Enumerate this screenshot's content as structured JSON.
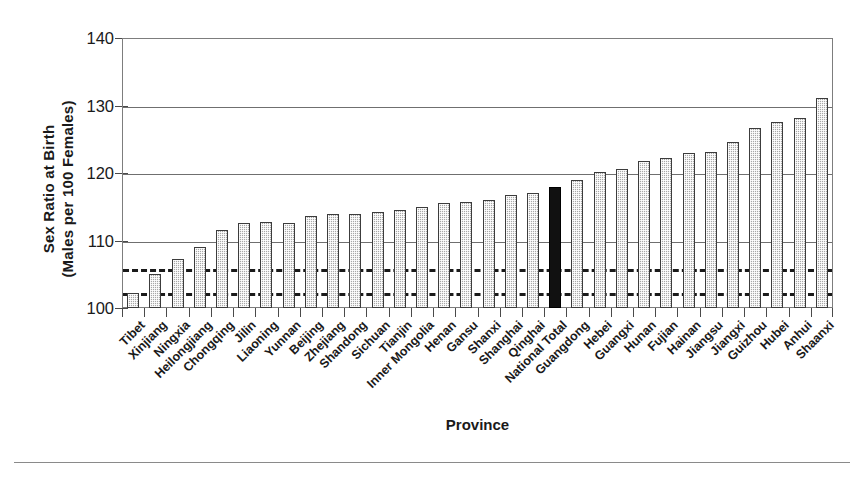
{
  "chart_data": {
    "type": "bar",
    "title": "",
    "subtitle": "",
    "xlabel": "Province",
    "ylabel": "Sex Ratio at Birth\n(Males per 100 Females)",
    "ylim": [
      100,
      140
    ],
    "yticks": [
      100,
      110,
      120,
      130,
      140
    ],
    "ytick_labels": [
      "100",
      "110",
      "120",
      "130",
      "140"
    ],
    "grid": "horizontal-major",
    "legend": "none",
    "highlight_category": "National Total",
    "highlight_color": "#111111",
    "bar_color": "#a8a8a8",
    "reference_lines": [
      {
        "value": 106.0,
        "style": "dashed",
        "label": ""
      },
      {
        "value": 102.3,
        "style": "dashed",
        "label": ""
      }
    ],
    "categories": [
      "Tibet",
      "Xinjiang",
      "Ningxia",
      "Heilongjiang",
      "Chongqing",
      "Jilin",
      "Liaoning",
      "Yunnan",
      "Beijing",
      "Zhejiang",
      "Shandong",
      "Sichuan",
      "Tianjin",
      "Inner Mongolia",
      "Henan",
      "Gansu",
      "Shanxi",
      "Shanghai",
      "Qinghai",
      "National Total",
      "Guangdong",
      "Hebei",
      "Guangxi",
      "Hunan",
      "Fujian",
      "Hainan",
      "Jiangsu",
      "Jiangxi",
      "Guizhou",
      "Hubei",
      "Anhui",
      "Shaanxi"
    ],
    "values": [
      102.2,
      105.0,
      107.2,
      109.0,
      111.5,
      112.6,
      112.8,
      112.6,
      113.7,
      113.9,
      113.9,
      114.2,
      114.5,
      114.9,
      115.5,
      115.7,
      116.0,
      116.8,
      117.0,
      118.0,
      118.9,
      120.1,
      120.6,
      121.8,
      122.2,
      123.0,
      123.1,
      124.6,
      126.6,
      127.5,
      128.2,
      131.1
    ]
  },
  "axis": {
    "y_title_line1": "Sex Ratio at Birth",
    "y_title_line2": "(Males per 100 Females)",
    "x_title": "Province"
  }
}
